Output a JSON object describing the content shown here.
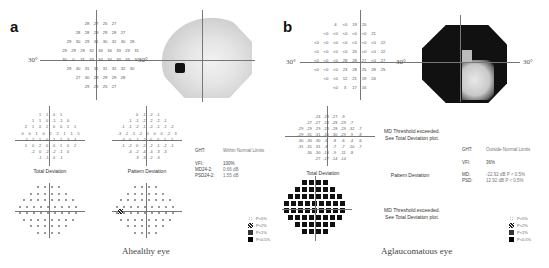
{
  "panels": {
    "a": {
      "letter": "a",
      "caption": "Ahealthy eye",
      "degree_left": "30°",
      "degree_right": "30°",
      "threshold_rows": [
        [
          "28",
          "27",
          "25",
          "27"
        ],
        [
          "28",
          "28",
          "29",
          "29",
          "28",
          "27"
        ],
        [
          "29",
          "30",
          "29",
          "31",
          "30",
          "32",
          "30",
          "28"
        ],
        [
          "29",
          "29",
          "29",
          "32",
          "34",
          "34",
          "33",
          "29",
          "31"
        ],
        [
          "30",
          "0",
          "31",
          "33",
          "34",
          "34",
          "33",
          "33",
          "30"
        ],
        [
          "29",
          "30",
          "31",
          "31",
          "31",
          "32",
          "32",
          "30"
        ],
        [
          "27",
          "30",
          "28",
          "29",
          "29",
          "28"
        ],
        [
          "29",
          "28",
          "25",
          "27"
        ]
      ],
      "total_deviation_label": "Total Deviation",
      "total_deviation_rows": [
        [
          "1",
          "1",
          "0",
          "1"
        ],
        [
          "1",
          "1",
          "0",
          "-1",
          "-1",
          "0"
        ],
        [
          "2",
          "1",
          "0",
          "2",
          "0",
          "0",
          "1",
          "1"
        ],
        [
          "0",
          "0",
          "1",
          "0",
          "2",
          "2",
          "1",
          "1",
          "5"
        ],
        [
          "-2",
          "2",
          "1",
          "0",
          "2",
          "2",
          "3",
          "4"
        ],
        [
          "1",
          "0",
          "2",
          "0",
          "0",
          "1",
          "0",
          "2"
        ],
        [
          "-2",
          "0",
          "-2",
          "-2",
          "-1",
          "0"
        ],
        [
          "-1",
          "-1",
          "0",
          "-1"
        ]
      ],
      "pattern_deviation_label": "Pattern Deviation",
      "pattern_deviation_rows": [
        [
          "0",
          "-1",
          "-2",
          "-1"
        ],
        [
          "-1",
          "-1",
          "-2",
          "-2",
          "-2",
          "-1"
        ],
        [
          "-1",
          "-1",
          "-2",
          "-1",
          "-2",
          "-1",
          "-1",
          "-2"
        ],
        [
          "-3",
          "-2",
          "-1",
          "-2",
          "0",
          "0",
          "0",
          "-2",
          "3"
        ],
        [
          "-4",
          "0",
          "-1",
          "-2",
          "0",
          "0",
          "1",
          "2"
        ],
        [
          "-1",
          "-2",
          "0",
          "-2",
          "-2",
          "-1",
          "-2",
          "-1"
        ],
        [
          "-4",
          "-2",
          "-4",
          "-4",
          "-3",
          "-3"
        ],
        [
          "-3",
          "-3",
          "-2",
          "-3"
        ]
      ],
      "stats": {
        "ght_label": "GHT:",
        "ght_value": "Within Normal Limits",
        "vfi_label": "VFI:",
        "vfi_value": "100%",
        "md_label": "MD24-2:",
        "md_value": "0.66 dB",
        "psd_label": "PSD24-2:",
        "psd_value": "1.55 dB"
      }
    },
    "b": {
      "letter": "b",
      "caption": "Aglaucomatous eye",
      "degree_left": "30°",
      "degree_right": "30°",
      "threshold_rows": [
        [
          "4",
          "<0",
          "19",
          "20"
        ],
        [
          "<0",
          "<0",
          "<0",
          "<0",
          "<0",
          "21"
        ],
        [
          "<0",
          "<0",
          "<0",
          "<0",
          "<0",
          "<0",
          "<0",
          "22"
        ],
        [
          "<0",
          "<0",
          "<0",
          "<0",
          "25",
          "<0",
          "<0",
          "22"
        ],
        [
          "<0",
          "<0",
          "<0",
          "28",
          "28",
          "27",
          "<0",
          "27"
        ],
        [
          "<0",
          "<0",
          "<0",
          "23",
          "28",
          "25",
          "28",
          "25"
        ],
        [
          "<0",
          "<0",
          "12",
          "21",
          "19",
          "24"
        ],
        [
          "<0",
          "3",
          "17",
          "16"
        ]
      ],
      "total_deviation_label": "Total Deviation",
      "total_deviation_rows": [
        [
          "-24",
          "-28",
          "-27",
          "-9"
        ],
        [
          "-27",
          "-27",
          "-28",
          "-28",
          "-29",
          "-7"
        ],
        [
          "-29",
          "-29",
          "-29",
          "-28",
          "-28",
          "-29",
          "-32",
          "-7"
        ],
        [
          "-29",
          "-31",
          "-31",
          "-30",
          "-30",
          "-29",
          "-9",
          "-8"
        ],
        [
          "-30",
          "-30",
          "-30",
          "-6",
          "-8",
          "-6",
          "-4",
          "-6"
        ],
        [
          "-31",
          "-31",
          "-31",
          "-8",
          "-7",
          "-7",
          "-10",
          "-7"
        ],
        [
          "-30",
          "-30",
          "-18",
          "-9",
          "-11",
          "-8"
        ],
        [
          "-27",
          "-27",
          "-14",
          "-14"
        ]
      ],
      "md_warning_1": "MD Threshold exceeded.",
      "md_warning_2": "See Total Deviation plot.",
      "pattern_deviation_label": "Pattern Deviation",
      "stats": {
        "ght_label": "GHT:",
        "ght_value": "Outside Normal Limits",
        "vfi_label": "VFI:",
        "vfi_value": "36%",
        "md_label": "MD:",
        "md_value": "-22.92 dB P < 0.5%",
        "psd_label": "PSD:",
        "psd_value": "12.92 dB P < 0.5%"
      }
    }
  },
  "legend": [
    {
      "symbol": "dots",
      "label": "P<5%"
    },
    {
      "symbol": "checker",
      "label": "P<2%"
    },
    {
      "symbol": "dense",
      "label": "P<1%"
    },
    {
      "symbol": "solid",
      "label": "P<0.5%"
    }
  ],
  "colors": {
    "text": "#333333",
    "axis": "#777777",
    "defect": "#111111",
    "normal_gray": "#cccccc"
  }
}
